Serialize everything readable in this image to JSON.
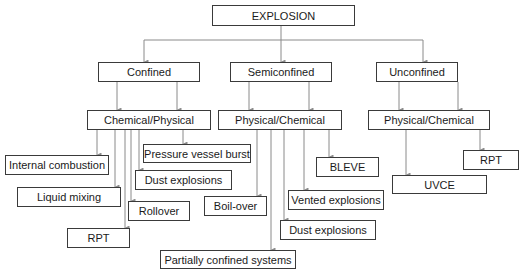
{
  "diagram": {
    "type": "tree",
    "line_color": "#8a8a8a",
    "border_color": "#3a3a3a",
    "root": {
      "label": "EXPLOSION"
    },
    "level1": [
      {
        "id": "confined",
        "label": "Confined"
      },
      {
        "id": "semiconfined",
        "label": "Semiconfined"
      },
      {
        "id": "unconfined",
        "label": "Unconfined"
      }
    ],
    "level2": [
      {
        "id": "confined-type",
        "parent": "confined",
        "label": "Chemical/Physical"
      },
      {
        "id": "semiconfined-type",
        "parent": "semiconfined",
        "label": "Physical/Chemical"
      },
      {
        "id": "unconfined-type",
        "parent": "unconfined",
        "label": "Physical/Chemical"
      }
    ],
    "leaves": {
      "confined": [
        {
          "label": "Internal combustion"
        },
        {
          "label": "Liquid mixing"
        },
        {
          "label": "RPT"
        },
        {
          "label": "Rollover"
        },
        {
          "label": "Dust explosions"
        },
        {
          "label": "Pressure vessel burst"
        }
      ],
      "semiconfined": [
        {
          "label": "Boil-over"
        },
        {
          "label": "Partially confined systems"
        },
        {
          "label": "Dust explosions"
        },
        {
          "label": "Vented explosions"
        },
        {
          "label": "BLEVE"
        }
      ],
      "unconfined": [
        {
          "label": "UVCE"
        },
        {
          "label": "RPT"
        }
      ]
    }
  }
}
